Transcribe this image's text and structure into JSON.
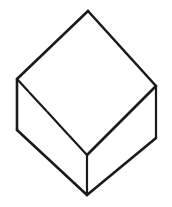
{
  "figure": {
    "caption": "",
    "style": "hand-drawn ink line drawing",
    "background_color": "#ffffff",
    "stroke_color": "#1a1a1a",
    "canvas": {
      "width": 172,
      "height": 207
    },
    "shape": {
      "name": "cube",
      "projection": "isometric",
      "visible_faces": 3,
      "face_fill": "#ffffff",
      "vertices": {
        "top_apex": {
          "x": 88,
          "y": 11
        },
        "left_upper": {
          "x": 17,
          "y": 79
        },
        "right_upper": {
          "x": 156,
          "y": 86
        },
        "center": {
          "x": 87,
          "y": 155
        },
        "left_lower": {
          "x": 17,
          "y": 130
        },
        "right_lower": {
          "x": 156,
          "y": 138
        },
        "bottom_apex": {
          "x": 87,
          "y": 195
        }
      },
      "faces": [
        {
          "name": "top-face",
          "points": "88,11 17,79 87,155 156,86"
        },
        {
          "name": "left-face",
          "points": "17,79 17,130 87,195 87,155"
        },
        {
          "name": "right-face",
          "points": "156,86 156,138 87,195 87,155"
        }
      ],
      "edges": [
        {
          "name": "edge-top-apex-to-left-upper",
          "points": "88,11 17,79",
          "weight": "heavy",
          "sketchy": false
        },
        {
          "name": "edge-top-apex-to-right-upper",
          "points": "88,11 156,86",
          "weight": "heavy",
          "sketchy": false
        },
        {
          "name": "edge-left-upper-to-center",
          "points": "17,79 87,155",
          "weight": "medium",
          "sketchy": true
        },
        {
          "name": "edge-right-upper-to-center",
          "points": "156,86 87,155",
          "weight": "heavy",
          "sketchy": false
        },
        {
          "name": "edge-left-vertical",
          "points": "17,79 17,130",
          "weight": "heavy",
          "sketchy": false
        },
        {
          "name": "edge-right-vertical",
          "points": "156,86 156,138",
          "weight": "medium",
          "sketchy": false
        },
        {
          "name": "edge-center-vertical",
          "points": "87,155 87,195",
          "weight": "medium",
          "sketchy": false
        },
        {
          "name": "edge-left-lower-to-bottom",
          "points": "17,130 87,195",
          "weight": "heavy",
          "sketchy": false
        },
        {
          "name": "edge-right-lower-to-bottom",
          "points": "156,138 87,195",
          "weight": "heavy",
          "sketchy": false
        }
      ]
    }
  }
}
